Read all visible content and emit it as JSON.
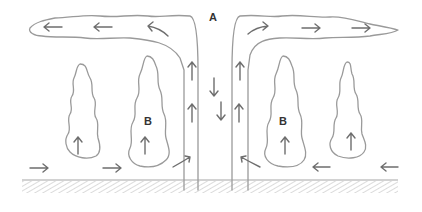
{
  "diagram": {
    "labels": {
      "top_center": "A",
      "left_cloud": "B",
      "right_cloud": "B"
    },
    "colors": {
      "outline": "#9a9a9a",
      "arrows": "#6e6e6e",
      "text": "#333333",
      "ground_hatch": "#b5b5b5"
    },
    "arrows": {
      "upper_left_outflow": [
        "left",
        "left",
        "curved-left"
      ],
      "upper_right_outflow": [
        "curved-right",
        "right",
        "right"
      ],
      "column_updraft_left": [
        "up",
        "up"
      ],
      "column_downdraft_center": [
        "down",
        "down"
      ],
      "column_updraft_right": [
        "up",
        "up"
      ],
      "cloud_updrafts": [
        "up",
        "up",
        "up",
        "up"
      ],
      "surface_left_inflow": [
        "right",
        "right",
        "curved-up-right"
      ],
      "surface_right_inflow": [
        "curved-up-left",
        "left",
        "left"
      ]
    }
  }
}
